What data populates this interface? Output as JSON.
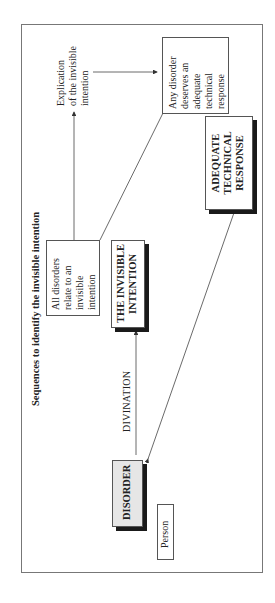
{
  "diagram": {
    "title": "Sequences to identify the invisible intention",
    "nodes": {
      "disorder": "DISORDER",
      "person": "Person",
      "invisible_intention": [
        "THE INVISIBLE",
        "INTENTION"
      ],
      "all_disorders": [
        "All disorders",
        "relate to an",
        "invisible",
        "intention"
      ],
      "explication": [
        "Explication",
        "of the invisible",
        "intention"
      ],
      "any_disorder": [
        "Any disorder",
        "deserves an",
        "adequate",
        "technical",
        "response"
      ],
      "adequate_response": [
        "ADEQUATE",
        "TECHNICAL",
        "RESPONSE"
      ]
    },
    "edge_labels": {
      "divination": "DIVINATION"
    },
    "colors": {
      "line": "#444444",
      "shadow": "#1a1a1a",
      "disorder_fill": "#e6e6e6"
    }
  }
}
